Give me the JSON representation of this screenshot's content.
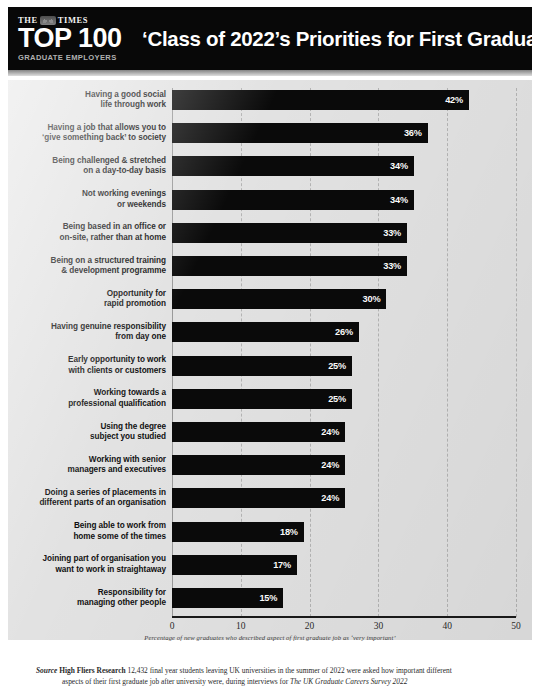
{
  "header": {
    "masthead": "THE",
    "masthead_suffix": "TIMES",
    "crest_icon": "times-crest-icon",
    "top100": "TOP 100",
    "subtitle": "GRADUATE EMPLOYERS",
    "title": "‘Class of 2022’s Priorities for First Graduate Job",
    "background_color": "#080808",
    "text_color": "#ffffff"
  },
  "chart_data": {
    "type": "bar",
    "orientation": "horizontal",
    "title": "‘Class of 2022’s Priorities for First Graduate Job",
    "xlabel": "Percentage of new graduates who described aspect of first graduate job as ‘very important’",
    "ylabel": "",
    "xlim": [
      0,
      50
    ],
    "xticks": [
      "0",
      "10",
      "20",
      "30",
      "40",
      "50"
    ],
    "grid": true,
    "legend": false,
    "bar_color": "#0a0a0a",
    "plot_background": "#e2e2e2",
    "categories": [
      "Having a good social life through work",
      "Having a job that allows you to ‘give something back’ to society",
      "Being challenged & stretched on a day-to-day basis",
      "Not working evenings or weekends",
      "Being based in an office or on-site, rather than at home",
      "Being on a structured training & development programme",
      "Opportunity for rapid promotion",
      "Having genuine responsibility from day one",
      "Early opportunity to work with clients or customers",
      "Working towards a professional qualification",
      "Using the degree subject you studied",
      "Working with senior managers and executives",
      "Doing a series of placements in different parts of an organisation",
      "Being able to work from home some of the times",
      "Joining part of organisation you want to work in straightaway",
      "Responsibility for managing other people"
    ],
    "values": [
      42,
      36,
      34,
      34,
      33,
      33,
      30,
      26,
      25,
      25,
      24,
      24,
      24,
      18,
      17,
      15
    ],
    "value_labels": [
      "42%",
      "36%",
      "34%",
      "34%",
      "33%",
      "33%",
      "30%",
      "26%",
      "25%",
      "25%",
      "24%",
      "24%",
      "24%",
      "18%",
      "17%",
      "15%"
    ]
  },
  "rows": [
    {
      "label_line1": "Having a good social",
      "label_line2": "life through work",
      "value": "42%"
    },
    {
      "label_line1": "Having a job that allows you to",
      "label_line2": "‘give something back’ to society",
      "value": "36%"
    },
    {
      "label_line1": "Being challenged & stretched",
      "label_line2": "on a day-to-day basis",
      "value": "34%"
    },
    {
      "label_line1": "Not working evenings",
      "label_line2": "or weekends",
      "value": "34%"
    },
    {
      "label_line1": "Being based in an office or",
      "label_line2": "on-site, rather than at home",
      "value": "33%"
    },
    {
      "label_line1": "Being on a structured training",
      "label_line2": "& development programme",
      "value": "33%"
    },
    {
      "label_line1": "Opportunity for",
      "label_line2": "rapid promotion",
      "value": "30%"
    },
    {
      "label_line1": "Having genuine responsibility",
      "label_line2": "from day one",
      "value": "26%"
    },
    {
      "label_line1": "Early opportunity to work",
      "label_line2": "with clients or customers",
      "value": "25%"
    },
    {
      "label_line1": "Working towards a",
      "label_line2": "professional qualification",
      "value": "25%"
    },
    {
      "label_line1": "Using the degree",
      "label_line2": "subject you studied",
      "value": "24%"
    },
    {
      "label_line1": "Working with senior",
      "label_line2": "managers and executives",
      "value": "24%"
    },
    {
      "label_line1": "Doing a series of placements in",
      "label_line2": "different parts of an organisation",
      "value": "24%"
    },
    {
      "label_line1": "Being able to work from",
      "label_line2": "home some of the times",
      "value": "18%"
    },
    {
      "label_line1": "Joining part of organisation you",
      "label_line2": "want to work in straightaway",
      "value": "17%"
    },
    {
      "label_line1": "Responsibility for",
      "label_line2": "managing other people",
      "value": "15%"
    }
  ],
  "footer": {
    "source_word": "Source",
    "organisation": "High Fliers Research",
    "body": "12,432 final year students leaving UK universities in the summer of 2022 were asked how important different",
    "body2": "aspects of their first graduate job after university were, during interviews for",
    "survey": "The UK Graduate Careers Survey 2022"
  }
}
